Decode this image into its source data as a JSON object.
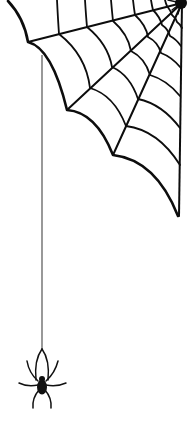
{
  "image": {
    "subject": "spider-web-with-hanging-spider",
    "background": "#ffffff",
    "ink": "#0d0d0d",
    "thread": "#444444",
    "elements": [
      {
        "name": "spider-web-icon",
        "position": "top-right corner"
      },
      {
        "name": "silk-thread",
        "position": "left, vertical"
      },
      {
        "name": "spider-icon",
        "position": "bottom-left"
      }
    ]
  }
}
